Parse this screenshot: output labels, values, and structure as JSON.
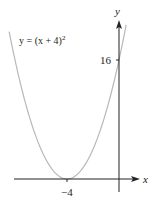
{
  "chart_data": {
    "type": "line",
    "title": "",
    "equation_label": "y = (x + 4)²",
    "xlabel": "x",
    "ylabel": "y",
    "annotations": [
      {
        "text": "16",
        "at": "y-intercept",
        "x": 0,
        "y": 16
      },
      {
        "text": "−4",
        "at": "vertex",
        "x": -4,
        "y": 0
      }
    ],
    "series": [
      {
        "name": "y = (x + 4)^2",
        "function": "(x+4)^2",
        "x": [
          -8.5,
          -8,
          -7,
          -6,
          -5,
          -4,
          -3,
          -2,
          -1,
          0,
          0.5
        ],
        "y": [
          20.25,
          16,
          9,
          4,
          1,
          0,
          1,
          4,
          9,
          16,
          20.25
        ]
      }
    ],
    "xlim": [
      -8.5,
      1.5
    ],
    "ylim": [
      -2,
      22
    ],
    "grid": false,
    "legend": "none",
    "colors": {
      "curve": "#b8b8b8",
      "axes": "#222222"
    }
  },
  "labels": {
    "equation_main": "y = (x + 4)",
    "equation_exp": "2",
    "y_axis": "y",
    "x_axis": "x",
    "y_tick": "16",
    "x_tick": "−4"
  }
}
